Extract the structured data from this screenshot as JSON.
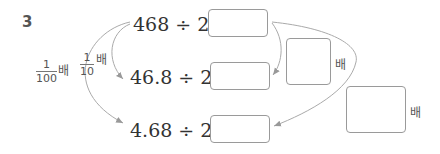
{
  "problem_number": "3",
  "equations": [
    {
      "expr": "468 ÷ 2 =",
      "answer": ""
    },
    {
      "expr": "46.8 ÷ 2 =",
      "answer": ""
    },
    {
      "expr": "4.68 ÷ 2 =",
      "answer": ""
    }
  ],
  "left_labels": {
    "tenth": {
      "numerator": "1",
      "denominator": "10",
      "unit": "배"
    },
    "hundredth": {
      "numerator": "1",
      "denominator": "100",
      "unit": "배"
    }
  },
  "right_labels": {
    "first": {
      "answer": "",
      "unit": "배"
    },
    "second": {
      "answer": "",
      "unit": "배"
    }
  },
  "colors": {
    "arrow": "#aaaaaa",
    "box_border": "#9a9a9a",
    "text": "#333333"
  }
}
